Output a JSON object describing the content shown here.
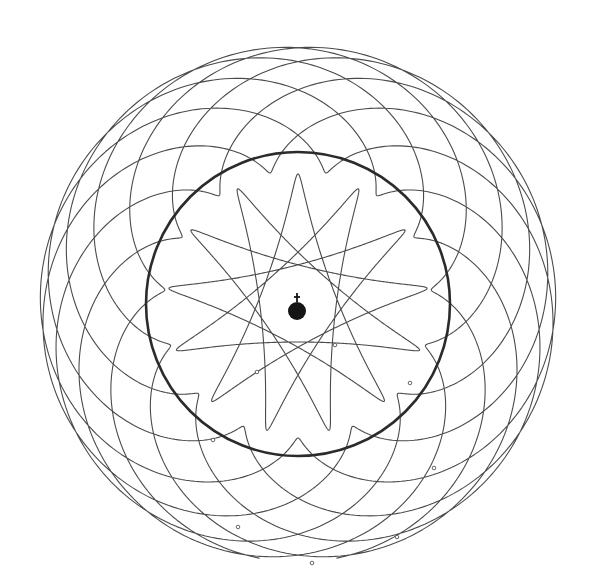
{
  "figure": {
    "description": "Geocentric diagram of planetary paths: Earth at center, the Sun's circular path (bold), an inner five-looped path and an outer multi-lobed path",
    "background": "#ffffff",
    "line_color": "#4a4a4a",
    "center": [
      298,
      304
    ],
    "earth": {
      "symbol": "earth-globus-cruciger-icon",
      "body_radius": 9,
      "color": "#151515"
    },
    "sun_orbit": {
      "radius": 152,
      "stroke_width": 2.6,
      "color": "#2b2b2b"
    },
    "inner_path": {
      "loops": 5,
      "deferent_radius": 84,
      "epicycle_radius": 46,
      "epicycle_ratio": -1.6,
      "rotation_deg": -90,
      "turns": 5
    },
    "outer_path": {
      "deferent_radius": 196,
      "epicycle_radius": 62,
      "epicycle_ratio": 2.875,
      "rotation_deg": 90,
      "turns": 8,
      "gap_deg": 6
    },
    "markers": [
      [
        335,
        345
      ],
      [
        257,
        372
      ],
      [
        410,
        383
      ],
      [
        213,
        440
      ],
      [
        434,
        468
      ],
      [
        238,
        527
      ],
      [
        397,
        537
      ],
      [
        312,
        563
      ]
    ]
  }
}
